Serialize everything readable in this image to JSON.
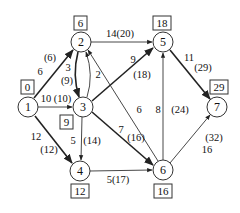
{
  "diagram": {
    "type": "directed-weighted-graph",
    "nodes": [
      {
        "id": "1",
        "label": "1",
        "x": 28,
        "y": 107,
        "box": "0",
        "bx": 27,
        "by": 87
      },
      {
        "id": "2",
        "label": "2",
        "x": 81,
        "y": 42,
        "box": "6",
        "bx": 81,
        "by": 23
      },
      {
        "id": "3",
        "label": "3",
        "x": 83,
        "y": 107,
        "box": "9",
        "bx": 67,
        "by": 122
      },
      {
        "id": "4",
        "label": "4",
        "x": 80,
        "y": 171,
        "box": "12",
        "bx": 80,
        "by": 191
      },
      {
        "id": "5",
        "label": "5",
        "x": 163,
        "y": 42,
        "box": "18",
        "bx": 162,
        "by": 23
      },
      {
        "id": "6",
        "label": "6",
        "x": 163,
        "y": 170,
        "box": "16",
        "bx": 163,
        "by": 191
      },
      {
        "id": "7",
        "label": "7",
        "x": 217,
        "y": 107,
        "box": "29",
        "bx": 219,
        "by": 87
      }
    ],
    "edges": [
      {
        "from": "1",
        "to": "2",
        "weight": "6",
        "label2": "(6)",
        "thick": true
      },
      {
        "from": "1",
        "to": "3",
        "weight": "10",
        "label2": "(10)",
        "thick": false
      },
      {
        "from": "1",
        "to": "4",
        "weight": "12",
        "label2": "(12)",
        "thick": true
      },
      {
        "from": "2",
        "to": "3",
        "weight": "3",
        "label2": "(9)",
        "thick": true
      },
      {
        "from": "3",
        "to": "2",
        "weight": "2",
        "label2": "",
        "thick": false
      },
      {
        "from": "2",
        "to": "5",
        "weight": "14",
        "label2": "(20)",
        "thick": false
      },
      {
        "from": "3",
        "to": "5",
        "weight": "9",
        "label2": "(18)",
        "thick": true
      },
      {
        "from": "3",
        "to": "4",
        "weight": "5",
        "label2": "(14)",
        "thick": false
      },
      {
        "from": "3",
        "to": "6",
        "weight": "7",
        "label2": "(16)",
        "thick": true
      },
      {
        "from": "6",
        "to": "2",
        "weight": "6",
        "label2": "",
        "thick": false
      },
      {
        "from": "4",
        "to": "6",
        "weight": "5",
        "label2": "(17)",
        "thick": false
      },
      {
        "from": "6",
        "to": "5",
        "weight": "8",
        "label2": "(24)",
        "thick": false
      },
      {
        "from": "5",
        "to": "7",
        "weight": "11",
        "label2": "(29)",
        "thick": true
      },
      {
        "from": "6",
        "to": "7",
        "weight": "16",
        "label2": "(32)",
        "thick": false
      }
    ],
    "edge_labels": {
      "e12_w": "6",
      "e12_p": "(6)",
      "e13": "10 (10)",
      "e14_w": "12",
      "e14_p": "(12)",
      "e23_w": "3",
      "e23_p": "(9)",
      "e32_w": "2",
      "e25": "14(20)",
      "e35_w": "9",
      "e35_p": "(18)",
      "e34_w": "5",
      "e34_p": "(14)",
      "e36_w": "7",
      "e36_p": "(16)",
      "e62_w": "6",
      "e46": "5(17)",
      "e65_w": "8",
      "e65_p": "(24)",
      "e57_w": "11",
      "e57_p": "(29)",
      "e67_w": "16",
      "e67_p": "(32)"
    }
  }
}
